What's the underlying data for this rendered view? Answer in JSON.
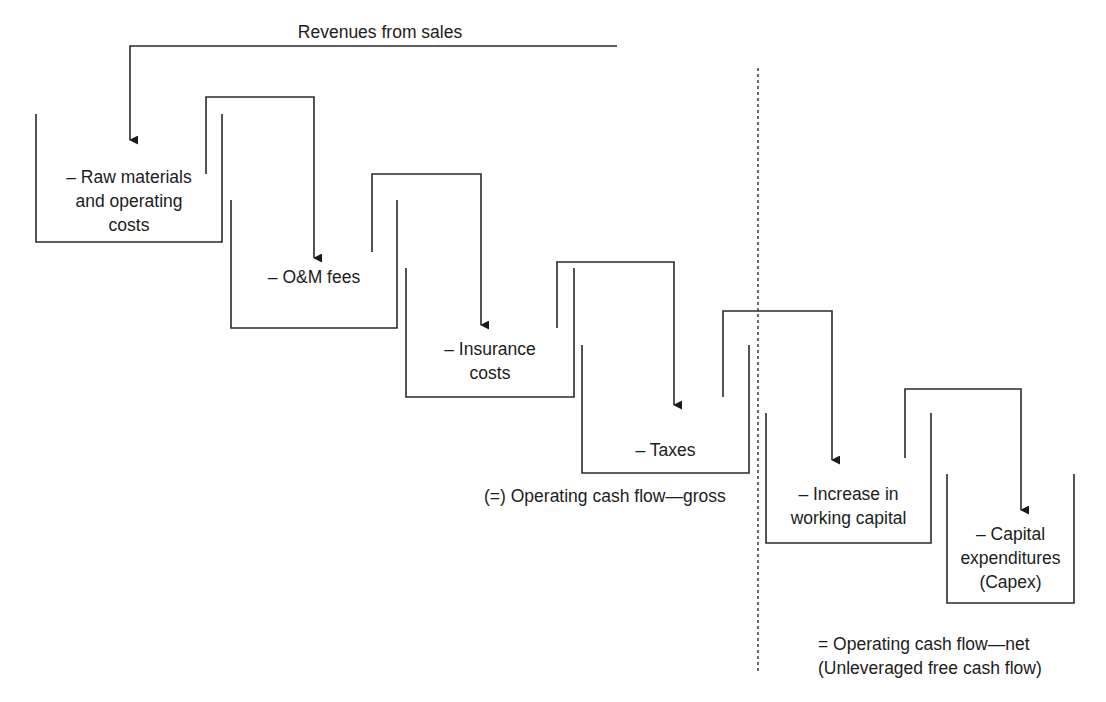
{
  "diagram": {
    "title_label": "Revenues from sales",
    "revenue_line": {
      "x1": 130,
      "x2": 617,
      "y": 46,
      "arrow_to_y": 140
    },
    "divider": {
      "x": 758,
      "y1": 68,
      "y2": 673
    },
    "buckets": [
      {
        "id": "raw-materials",
        "label": "– Raw materials\nand operating\ncosts",
        "left": 36,
        "right": 222,
        "top": 114,
        "bottom": 242,
        "label_x": 36,
        "label_y": 165,
        "label_w": 186
      },
      {
        "id": "om-fees",
        "label": "– O&M fees",
        "left": 231,
        "right": 397,
        "top": 200,
        "bottom": 328,
        "label_x": 231,
        "label_y": 265,
        "label_w": 166
      },
      {
        "id": "insurance",
        "label": "– Insurance\ncosts",
        "left": 406,
        "right": 574,
        "top": 268,
        "bottom": 397,
        "label_x": 406,
        "label_y": 337,
        "label_w": 168
      },
      {
        "id": "taxes",
        "label": "– Taxes",
        "left": 582,
        "right": 749,
        "top": 345,
        "bottom": 473,
        "label_x": 582,
        "label_y": 438,
        "label_w": 167
      },
      {
        "id": "working-capital",
        "label": "– Increase in\nworking capital",
        "left": 766,
        "right": 931,
        "top": 413,
        "bottom": 543,
        "label_x": 766,
        "label_y": 482,
        "label_w": 165
      },
      {
        "id": "capex",
        "label": "– Capital\nexpenditures\n(Capex)",
        "left": 947,
        "right": 1074,
        "top": 474,
        "bottom": 603,
        "label_x": 947,
        "label_y": 522,
        "label_w": 127
      }
    ],
    "connectors": [
      {
        "from_x": 206,
        "from_y": 174,
        "top_y": 97,
        "to_x": 314,
        "to_y": 258
      },
      {
        "from_x": 372,
        "from_y": 252,
        "top_y": 174,
        "to_x": 481,
        "to_y": 325
      },
      {
        "from_x": 557,
        "from_y": 328,
        "top_y": 262,
        "to_x": 674,
        "to_y": 405
      },
      {
        "from_x": 723,
        "from_y": 397,
        "top_y": 311,
        "to_x": 832,
        "to_y": 460
      },
      {
        "from_x": 905,
        "from_y": 458,
        "top_y": 389,
        "to_x": 1021,
        "to_y": 510
      }
    ],
    "result_gross": {
      "label": "(=) Operating cash flow—gross",
      "x": 484,
      "y": 484
    },
    "result_net": {
      "label": "= Operating cash flow—net\n(Unleveraged free cash flow)",
      "x": 818,
      "y": 632
    }
  }
}
